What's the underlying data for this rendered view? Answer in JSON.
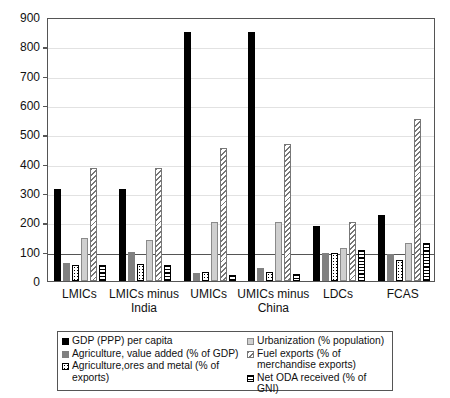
{
  "chart_data": {
    "type": "bar",
    "title": "",
    "xlabel": "",
    "ylabel": "",
    "ylim": [
      0,
      900
    ],
    "yticks": [
      0,
      100,
      200,
      300,
      400,
      500,
      600,
      700,
      800,
      900
    ],
    "grid": true,
    "legend_position": "bottom",
    "categories": [
      "LMICs",
      "LMICs  minus India",
      "UMICs",
      "UMICs minus China",
      "LDCs",
      "FCAS"
    ],
    "series": [
      {
        "name": "GDP (PPP) per capita",
        "pattern": "solid-black",
        "values": [
          315,
          315,
          848,
          850,
          188,
          225
        ]
      },
      {
        "name": "Agriculture, value added (% of GDP)",
        "pattern": "solid-gray",
        "values": [
          60,
          100,
          27,
          45,
          95,
          93
        ]
      },
      {
        "name": "Agriculture,ores and metal (% of exports)",
        "pattern": "dotted",
        "values": [
          55,
          57,
          32,
          30,
          95,
          73
        ]
      },
      {
        "name": "Urbanization (% population)",
        "pattern": "light-gray",
        "values": [
          145,
          140,
          200,
          202,
          112,
          128
        ]
      },
      {
        "name": "Fuel exports (% of merchandise exports)",
        "pattern": "diagonal-hatch",
        "values": [
          385,
          385,
          455,
          467,
          200,
          552
        ]
      },
      {
        "name": "Net ODA received (% of GNI)",
        "pattern": "horizontal-hatch",
        "values": [
          55,
          55,
          22,
          25,
          105,
          130
        ]
      }
    ]
  },
  "axis": {
    "y_tick_labels": [
      "0",
      "100",
      "200",
      "300",
      "400",
      "500",
      "600",
      "700",
      "800",
      "900"
    ]
  },
  "legend": {
    "left_items": [
      "GDP (PPP) per capita",
      "Agriculture, value added (% of GDP)",
      "Agriculture,ores and metal (% of exports)"
    ],
    "right_items": [
      "Urbanization (% population)",
      "Fuel exports (% of merchandise exports)",
      "Net ODA received (% of GNI)"
    ]
  }
}
